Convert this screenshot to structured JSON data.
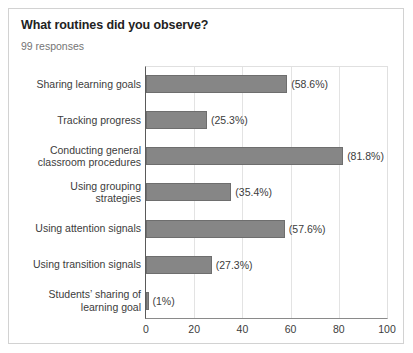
{
  "card": {
    "title": "What routines did you observe?",
    "response_count": "99 responses"
  },
  "chart_data": {
    "type": "bar",
    "orientation": "horizontal",
    "title": "What routines did you observe?",
    "subtitle": "99 responses",
    "xlabel": "",
    "ylabel": "",
    "xlim": [
      0,
      100
    ],
    "xticks": [
      "0",
      "20",
      "40",
      "60",
      "80",
      "100"
    ],
    "xtick_values": [
      0,
      20,
      40,
      60,
      80,
      100
    ],
    "grid": "vertical",
    "legend": "none",
    "bar_color": "#868686",
    "bar_border_color": "#6e6e6e",
    "categories": [
      "Sharing learning goals",
      "Tracking progress",
      "Conducting general\nclassroom procedures",
      "Using grouping\nstrategies",
      "Using attention signals",
      "Using transition signals",
      "Students’ sharing of\nlearning goal"
    ],
    "values": [
      58.6,
      25.3,
      81.8,
      35.4,
      57.6,
      27.3,
      1
    ],
    "value_labels": [
      "(58.6%)",
      "(25.3%)",
      "(81.8%)",
      "(35.4%)",
      "(57.6%)",
      "(27.3%)",
      "(1%)"
    ]
  },
  "colors": {
    "card_border": "#d2d2d2",
    "title_text": "#222222",
    "muted_text": "#757575",
    "axis_text": "#3c3c3c",
    "gridline": "#e3e3e3",
    "axis_line": "#5a5a5a"
  }
}
